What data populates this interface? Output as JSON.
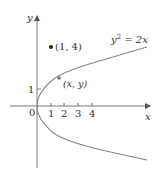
{
  "diagram": {
    "axes": {
      "x_label": "x",
      "y_label": "y",
      "origin_label": "0",
      "x_ticks": [
        "1",
        "2",
        "3",
        "4"
      ],
      "y_ticks": [
        "1"
      ]
    },
    "curve": {
      "equation_lhs": "y",
      "equation_exp": "2",
      "equation_rhs": " = 2x",
      "color": "#888888"
    },
    "points": [
      {
        "label": "(1, 4)",
        "x": 1,
        "y": 4
      },
      {
        "label": "(x, y)",
        "x": "x",
        "y": "y"
      }
    ]
  }
}
